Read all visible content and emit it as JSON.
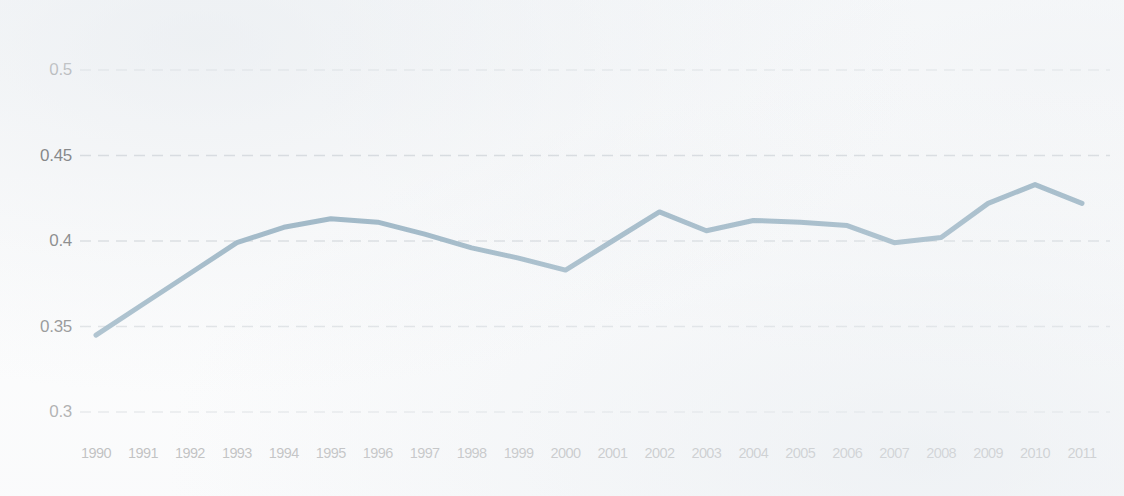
{
  "chart_data": {
    "type": "line",
    "title": "",
    "subtitle": "",
    "xlabel": "",
    "ylabel": "",
    "x": [
      1990,
      1991,
      1992,
      1993,
      1994,
      1995,
      1996,
      1997,
      1998,
      1999,
      2000,
      2001,
      2002,
      2003,
      2004,
      2005,
      2006,
      2007,
      2008,
      2009,
      2010,
      2011
    ],
    "categories": [
      "1990",
      "1991",
      "1992",
      "1993",
      "1994",
      "1995",
      "1996",
      "1997",
      "1998",
      "1999",
      "2000",
      "2001",
      "2002",
      "2003",
      "2004",
      "2005",
      "2006",
      "2007",
      "2008",
      "2009",
      "2010",
      "2011"
    ],
    "values": [
      0.345,
      0.363,
      0.381,
      0.399,
      0.408,
      0.413,
      0.411,
      0.404,
      0.396,
      0.39,
      0.383,
      0.4,
      0.417,
      0.406,
      0.412,
      0.411,
      0.409,
      0.399,
      0.402,
      0.422,
      0.433,
      0.422
    ],
    "series": [
      {
        "name": "",
        "color": "#4a7a96",
        "values": [
          0.345,
          0.363,
          0.381,
          0.399,
          0.408,
          0.413,
          0.411,
          0.404,
          0.396,
          0.39,
          0.383,
          0.4,
          0.417,
          0.406,
          0.412,
          0.411,
          0.409,
          0.399,
          0.402,
          0.422,
          0.433,
          0.422
        ]
      }
    ],
    "ylim": [
      0.3,
      0.5
    ],
    "y_ticks": [
      0.3,
      0.35,
      0.4,
      0.45,
      0.5
    ],
    "y_tick_labels": [
      "0.3",
      "0.35",
      "0.4",
      "0.45",
      "0.5"
    ],
    "grid": true,
    "grid_axis": "y",
    "grid_style": "dashed",
    "grid_color": "#c6cbd0",
    "legend": false,
    "legend_position": "none",
    "markers": false,
    "line_width": 5,
    "background_color": "#fdfdfd",
    "axis_text_color": "#2b2b2b"
  },
  "layout": {
    "plot_left": 96,
    "plot_right": 1082,
    "y_top_px": 70,
    "y_bottom_px": 412,
    "y_top_value": 0.5,
    "y_bottom_value": 0.3,
    "x_label_y": 445,
    "y_label_right": 72
  }
}
